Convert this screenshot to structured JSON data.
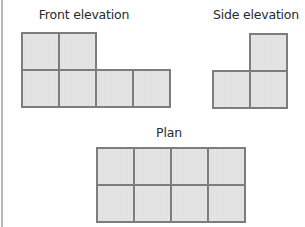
{
  "diagram": {
    "views": [
      {
        "name": "front-elevation",
        "label": "Front elevation",
        "label_pos": {
          "x": 84,
          "y": 7
        },
        "origin": {
          "x": 21,
          "y": 32
        },
        "cell": 37,
        "cells": [
          [
            0,
            0
          ],
          [
            1,
            0
          ],
          [
            0,
            1
          ],
          [
            1,
            1
          ],
          [
            2,
            1
          ],
          [
            3,
            1
          ]
        ]
      },
      {
        "name": "side-elevation",
        "label": "Side elevation",
        "label_pos": {
          "x": 256,
          "y": 7
        },
        "origin": {
          "x": 212,
          "y": 33
        },
        "cell": 37,
        "cells": [
          [
            1,
            0
          ],
          [
            0,
            1
          ],
          [
            1,
            1
          ]
        ]
      },
      {
        "name": "plan",
        "label": "Plan",
        "label_pos": {
          "x": 169,
          "y": 125
        },
        "origin": {
          "x": 96,
          "y": 147
        },
        "cell": 37,
        "cells": [
          [
            0,
            0
          ],
          [
            1,
            0
          ],
          [
            2,
            0
          ],
          [
            3,
            0
          ],
          [
            0,
            1
          ],
          [
            1,
            1
          ],
          [
            2,
            1
          ],
          [
            3,
            1
          ]
        ]
      }
    ],
    "colors": {
      "fill": "#e1e1e1",
      "stroke": "#7d7d7d",
      "text": "#2a2a2a"
    }
  }
}
